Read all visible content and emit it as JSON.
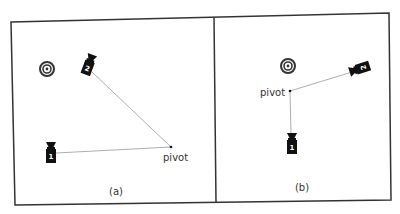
{
  "figure": {
    "panels": [
      {
        "id": "a",
        "caption": "(a)",
        "pivot_label": "pivot",
        "cameras": [
          {
            "number": "1"
          },
          {
            "number": "2"
          }
        ]
      },
      {
        "id": "b",
        "caption": "(b)",
        "pivot_label": "pivot",
        "cameras": [
          {
            "number": "1"
          },
          {
            "number": "2"
          }
        ]
      }
    ],
    "icons": {
      "target": "target-bullseye-icon",
      "camera": "camera-icon",
      "pivot": "pivot-point"
    },
    "colors": {
      "frame": "#333333",
      "line": "#999999",
      "camera": "#111111",
      "text": "#333333"
    }
  }
}
